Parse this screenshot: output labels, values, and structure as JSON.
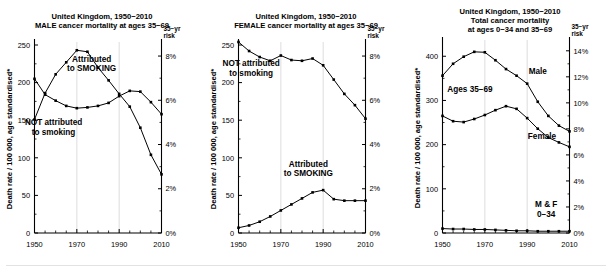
{
  "figure": {
    "footnote_rule": true,
    "axis_note_marker": "*"
  },
  "chart_data": [
    {
      "id": "male-35-69",
      "type": "line",
      "title": [
        "United Kingdom, 1950−2010",
        "MALE cancer mortality at ages 35−69"
      ],
      "ylabel": "Death rate / 100 000, age standardised*",
      "xlabel": "",
      "right_axis_label": [
        "35−yr",
        "risk"
      ],
      "xlim": [
        1950,
        2010
      ],
      "ylim": [
        0,
        250
      ],
      "xticks": [
        1950,
        1970,
        1990,
        2010
      ],
      "xticklabels": [
        "1950",
        "1970",
        "1990",
        "2010"
      ],
      "xminorticks": [
        1955,
        1960,
        1965,
        1975,
        1980,
        1985,
        1995,
        2000,
        2005
      ],
      "yticks": [
        0,
        50,
        100,
        150,
        200,
        250
      ],
      "yticklabels": [
        "0",
        "50",
        "100",
        "150",
        "200",
        "250"
      ],
      "right_ticks_pct": [
        0,
        2,
        4,
        6,
        8
      ],
      "right_ticklabels": [
        "0%",
        "2%",
        "4%",
        "6%",
        "8%"
      ],
      "right_axis_max_pct": 8.5,
      "grid": "vertical-at-1970-1990",
      "annotations": [
        {
          "text": [
            "Attributed",
            "to SMOKING"
          ],
          "x": 1977,
          "y": 228
        },
        {
          "text": [
            "NOT attributed",
            "to smoking"
          ],
          "x": 1959,
          "y": 143
        }
      ],
      "x": [
        1950,
        1955,
        1960,
        1965,
        1970,
        1975,
        1980,
        1985,
        1990,
        1995,
        2000,
        2005,
        2010
      ],
      "series": [
        {
          "name": "Attributed to SMOKING",
          "values": [
            151,
            186,
            211,
            227,
            243,
            241,
            220,
            203,
            185,
            168,
            140,
            104,
            78
          ]
        },
        {
          "name": "NOT attributed to smoking",
          "values": [
            205,
            184,
            176,
            169,
            166,
            167,
            169,
            173,
            182,
            189,
            188,
            174,
            158
          ]
        }
      ]
    },
    {
      "id": "female-35-69",
      "type": "line",
      "title": [
        "United Kingdom, 1950−2010",
        "FEMALE cancer mortality at ages 35−69"
      ],
      "ylabel": "Death rate / 100 000, age standardised*",
      "xlabel": "",
      "right_axis_label": [
        "35−yr",
        "risk"
      ],
      "xlim": [
        1950,
        2010
      ],
      "ylim": [
        0,
        250
      ],
      "xticks": [
        1950,
        1970,
        1990,
        2010
      ],
      "xticklabels": [
        "1950",
        "1970",
        "1990",
        "2010"
      ],
      "xminorticks": [
        1955,
        1960,
        1965,
        1975,
        1980,
        1985,
        1995,
        2000,
        2005
      ],
      "yticks": [
        0,
        50,
        100,
        150,
        200,
        250
      ],
      "yticklabels": [
        "0",
        "50",
        "100",
        "150",
        "200",
        "250"
      ],
      "right_ticks_pct": [
        0,
        2,
        4,
        6,
        8
      ],
      "right_ticklabels": [
        "0%",
        "2%",
        "4%",
        "6%",
        "8%"
      ],
      "right_axis_max_pct": 8.5,
      "grid": "vertical-at-1970-1990",
      "annotations": [
        {
          "text": [
            "NOT attributed",
            "to smoking"
          ],
          "x": 1956,
          "y": 222
        },
        {
          "text": [
            "Attributed",
            "to SMOKING"
          ],
          "x": 1983,
          "y": 88
        }
      ],
      "x": [
        1950,
        1955,
        1960,
        1965,
        1970,
        1975,
        1980,
        1985,
        1990,
        1995,
        2000,
        2005,
        2010
      ],
      "series": [
        {
          "name": "NOT attributed to smoking",
          "values": [
            254,
            242,
            234,
            229,
            236,
            230,
            229,
            232,
            223,
            204,
            185,
            170,
            152
          ]
        },
        {
          "name": "Attributed to SMOKING",
          "values": [
            7,
            10,
            15,
            22,
            30,
            38,
            46,
            54,
            57,
            45,
            43,
            43,
            43
          ]
        }
      ]
    },
    {
      "id": "total-0-34-and-35-69",
      "type": "line",
      "title": [
        "United Kingdom, 1950−2010",
        "Total cancer mortality",
        "at ages 0−34 and 35−69"
      ],
      "ylabel": "Death rate / 100 000, age standardised*",
      "xlabel": "",
      "right_axis_label": [
        "35−yr",
        "risk"
      ],
      "xlim": [
        1950,
        2010
      ],
      "ylim": [
        0,
        430
      ],
      "xticks": [
        1950,
        1970,
        1990,
        2010
      ],
      "xticklabels": [
        "1950",
        "1970",
        "1990",
        "2010"
      ],
      "xminorticks": [
        1955,
        1960,
        1965,
        1975,
        1980,
        1985,
        1995,
        2000,
        2005
      ],
      "yticks": [
        0,
        100,
        200,
        300,
        400
      ],
      "yticklabels": [
        "0",
        "100",
        "200",
        "300",
        "400"
      ],
      "right_ticks_pct": [
        0,
        2,
        4,
        6,
        8,
        10,
        12,
        14
      ],
      "right_ticklabels": [
        "0%",
        "2%",
        "4%",
        "6%",
        "8%",
        "10%",
        "12%",
        "14%"
      ],
      "right_axis_max_pct": 14.6,
      "grid": "vertical-at-1970-1990",
      "annotations": [
        {
          "text": [
            "Male"
          ],
          "x": 1995,
          "y": 360
        },
        {
          "text": [
            "Ages 35−69"
          ],
          "x": 1963,
          "y": 318
        },
        {
          "text": [
            "Female"
          ],
          "x": 1997,
          "y": 212
        },
        {
          "text": [
            "M & F",
            "0−34"
          ],
          "x": 1999,
          "y": 58
        }
      ],
      "x": [
        1950,
        1955,
        1960,
        1965,
        1970,
        1975,
        1980,
        1985,
        1990,
        1995,
        2000,
        2005,
        2010
      ],
      "series": [
        {
          "name": "Male",
          "values": [
            356,
            383,
            399,
            410,
            409,
            391,
            371,
            356,
            338,
            297,
            265,
            243,
            230
          ]
        },
        {
          "name": "Female",
          "values": [
            265,
            253,
            251,
            258,
            267,
            278,
            287,
            281,
            260,
            236,
            216,
            205,
            195
          ]
        },
        {
          "name": "M & F 0−34",
          "values": [
            10,
            9,
            9,
            8,
            8,
            7,
            6,
            5,
            5,
            4,
            4,
            4,
            4
          ]
        }
      ]
    }
  ]
}
